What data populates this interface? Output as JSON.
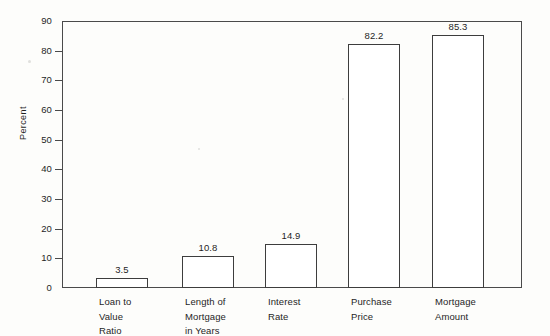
{
  "chart_data": {
    "type": "bar",
    "title": "",
    "subtitle": "",
    "xlabel": "",
    "ylabel": "Percent",
    "ylim": [
      0,
      90
    ],
    "ytick_step": 10,
    "yticks": [
      0,
      10,
      20,
      30,
      40,
      50,
      60,
      70,
      80,
      90
    ],
    "ytick_labels": [
      "0",
      "10",
      "20",
      "30",
      "40",
      "50",
      "60",
      "70",
      "80",
      "90"
    ],
    "grid": false,
    "legend": null,
    "legend_position": "none",
    "categories": [
      "Loan to Value Ratio",
      "Length of Mortgage in Years",
      "Interest Rate",
      "Purchase Price",
      "Mortgage Amount"
    ],
    "category_label_lines": [
      [
        "Loan to",
        "Value",
        "Ratio"
      ],
      [
        "Length of",
        "Mortgage",
        "in Years"
      ],
      [
        "Interest",
        "Rate"
      ],
      [
        "Purchase",
        "Price"
      ],
      [
        "Mortgage",
        "Amount"
      ]
    ],
    "values": [
      3.5,
      10.8,
      14.9,
      82.2,
      85.3
    ],
    "value_labels": [
      "3.5",
      "10.8",
      "14.9",
      "82.2",
      "85.3"
    ],
    "bar_fill_color": "#ffffff",
    "bar_edge_color": "#3d3d3d",
    "axis_color": "#4a4a4a",
    "text_color": "#1f1f1f",
    "background_color": "#fdfdfb"
  }
}
